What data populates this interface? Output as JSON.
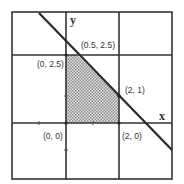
{
  "diagram": {
    "type": "feasible-region-plot",
    "axes": {
      "x_label": "x",
      "y_label": "y"
    },
    "colors": {
      "grid": "#333333",
      "line": "#2a2a2a",
      "shade": "#9a9a9a",
      "background": "#ffffff"
    },
    "points": [
      {
        "label": "(0, 2.5)",
        "x": 0,
        "y": 2.5
      },
      {
        "label": "(0.5, 2.5)",
        "x": 0.5,
        "y": 2.5
      },
      {
        "label": "(2, 1)",
        "x": 2,
        "y": 1
      },
      {
        "label": "(0, 0)",
        "x": 0,
        "y": 0
      },
      {
        "label": "(2, 0)",
        "x": 2,
        "y": 0
      }
    ],
    "constraint_line": "x + y = 3",
    "shaded_region": [
      "(0, 0)",
      "(0, 2.5)",
      "(0.5, 2.5)",
      "(2, 1)",
      "(2, 0)"
    ]
  }
}
